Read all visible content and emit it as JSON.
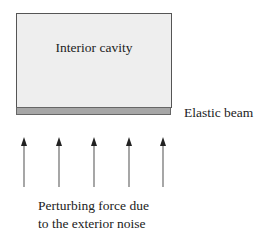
{
  "diagram": {
    "cavity": {
      "label": "Interior cavity",
      "fill": "#eeeeee"
    },
    "beam": {
      "label": "Elastic beam",
      "fill": "#a6a6a6"
    },
    "force": {
      "line1": "Perturbing force due",
      "line2": "to the exterior noise",
      "arrow_count": 5,
      "arrow_x": [
        24,
        59,
        94,
        129,
        163
      ]
    }
  }
}
